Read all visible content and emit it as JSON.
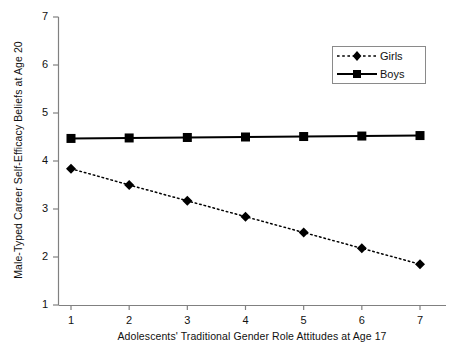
{
  "chart_data": {
    "type": "line",
    "title": "",
    "xlabel": "Adolescents'  Traditional Gender Role Attitudes at Age 17",
    "ylabel": "Male-Typed Career Self-Efficacy Beliefs at Age 20",
    "x": [
      1,
      2,
      3,
      4,
      5,
      6,
      7
    ],
    "xlim": [
      1,
      7
    ],
    "ylim": [
      1,
      7
    ],
    "xticks": [
      "1",
      "2",
      "3",
      "4",
      "5",
      "6",
      "7"
    ],
    "yticks": [
      "1",
      "2",
      "3",
      "4",
      "5",
      "6",
      "7"
    ],
    "grid": false,
    "legend_position": "top-right",
    "series": [
      {
        "name": "Girls",
        "marker": "diamond",
        "line_style": "dotted",
        "color": "#000000",
        "values": [
          3.84,
          3.5,
          3.17,
          2.84,
          2.51,
          2.18,
          1.85
        ]
      },
      {
        "name": "Boys",
        "marker": "square",
        "line_style": "solid",
        "color": "#000000",
        "values": [
          4.47,
          4.48,
          4.49,
          4.5,
          4.51,
          4.52,
          4.53
        ]
      }
    ]
  },
  "axes": {
    "y_title": "Male-Typed Career Self-Efficacy Beliefs at Age 20",
    "x_title": "Adolescents'  Traditional Gender Role Attitudes at Age 17"
  },
  "legend": {
    "items": [
      {
        "label": "Girls"
      },
      {
        "label": "Boys"
      }
    ]
  }
}
